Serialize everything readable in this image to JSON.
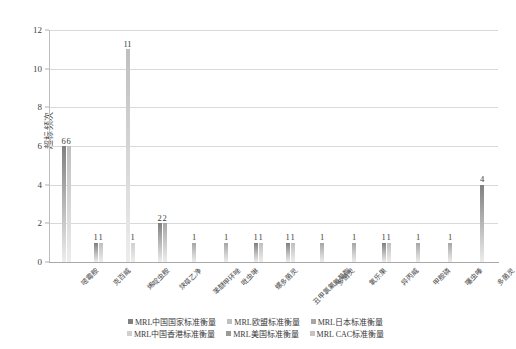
{
  "chart_data": {
    "type": "bar",
    "title": "",
    "xlabel": "",
    "ylabel": "超标频次",
    "ylim": [
      0,
      12
    ],
    "ytick_labels": [
      "0",
      "2",
      "4",
      "6",
      "8",
      "10",
      "12"
    ],
    "ytick_values": [
      0,
      2,
      4,
      6,
      8,
      10,
      12
    ],
    "grid": true,
    "legend_position": "bottom",
    "categories": [
      "嘧霉胺",
      "克百威",
      "烯啶虫胺",
      "炔草乙净",
      "苯醚甲环唑",
      "吡虫啉",
      "螺螨酯",
      "乙基氯氟氰菊酯",
      "多菌灵",
      "氧乐果",
      "异丙威",
      "甲胺磷",
      "噻虫嗪",
      "多菌灵"
    ],
    "series": [
      {
        "name": "MRL中国国家标准衡量",
        "color": "#808080"
      },
      {
        "name": "MRL欧盟标准衡量",
        "color": "#bfbfbf"
      },
      {
        "name": "MRL日本标准衡量",
        "color": "#a6a6a6"
      },
      {
        "name": "MRL中国香港标准衡量",
        "color": "#d0d0d0"
      },
      {
        "name": "MRL美国标准衡量",
        "color": "#9a9a9a"
      },
      {
        "name": "MRL CAC标准衡量",
        "color": "#c4c4c4"
      }
    ],
    "groups": [
      {
        "label": "嘧霉胺",
        "bars": [
          {
            "value": 6,
            "label": "6",
            "color": "#808080"
          },
          {
            "value": 6,
            "label": "6",
            "color": "#bfbfbf"
          }
        ]
      },
      {
        "label": "克百威",
        "bars": [
          {
            "value": 1,
            "label": "1",
            "color": "#808080"
          },
          {
            "value": 1,
            "label": "1",
            "color": "#bfbfbf"
          }
        ]
      },
      {
        "label": "烯啶虫胺",
        "bars": [
          {
            "value": 11,
            "label": "11",
            "color": "#bfbfbf"
          },
          {
            "value": 1,
            "label": "1",
            "color": "#d0d0d0"
          }
        ]
      },
      {
        "label": "炔草乙净",
        "bars": [
          {
            "value": 2,
            "label": "2",
            "color": "#808080"
          },
          {
            "value": 2,
            "label": "2",
            "color": "#a6a6a6"
          }
        ]
      },
      {
        "label": "苯醚甲环唑",
        "bars": [
          {
            "value": 1,
            "label": "1",
            "color": "#a6a6a6"
          }
        ]
      },
      {
        "label": "吡虫啉",
        "bars": [
          {
            "value": 1,
            "label": "1",
            "color": "#a6a6a6"
          }
        ]
      },
      {
        "label": "螺多菌灵",
        "bars": [
          {
            "value": 1,
            "label": "1",
            "color": "#808080"
          },
          {
            "value": 1,
            "label": "1",
            "color": "#bfbfbf"
          }
        ]
      },
      {
        "label": "丑甲氯氟氰菊酯",
        "bars": [
          {
            "value": 1,
            "label": "1",
            "color": "#808080"
          },
          {
            "value": 1,
            "label": "1",
            "color": "#bfbfbf"
          }
        ]
      },
      {
        "label": "多菌灵",
        "bars": [
          {
            "value": 1,
            "label": "1",
            "color": "#a6a6a6"
          }
        ]
      },
      {
        "label": "氧乐果",
        "bars": [
          {
            "value": 1,
            "label": "1",
            "color": "#a6a6a6"
          }
        ]
      },
      {
        "label": "异丙威",
        "bars": [
          {
            "value": 1,
            "label": "1",
            "color": "#808080"
          },
          {
            "value": 1,
            "label": "1",
            "color": "#bfbfbf"
          }
        ]
      },
      {
        "label": "甲胺磷",
        "bars": [
          {
            "value": 1,
            "label": "1",
            "color": "#a6a6a6"
          }
        ]
      },
      {
        "label": "噻虫嗪",
        "bars": [
          {
            "value": 1,
            "label": "1",
            "color": "#a6a6a6"
          }
        ]
      },
      {
        "label": "多菌灵",
        "bars": [
          {
            "value": 4,
            "label": "4",
            "color": "#808080"
          }
        ]
      }
    ],
    "legend_rows": [
      [
        "MRL中国国家标准衡量",
        "MRL欧盟标准衡量",
        "MRL日本标准衡量"
      ],
      [
        "MRL中国香港标准衡量",
        "MRL美国标准衡量",
        "MRL CAC标准衡量"
      ]
    ],
    "legend_colors": [
      [
        "#808080",
        "#bfbfbf",
        "#a6a6a6"
      ],
      [
        "#d0d0d0",
        "#9a9a9a",
        "#c4c4c4"
      ]
    ]
  }
}
